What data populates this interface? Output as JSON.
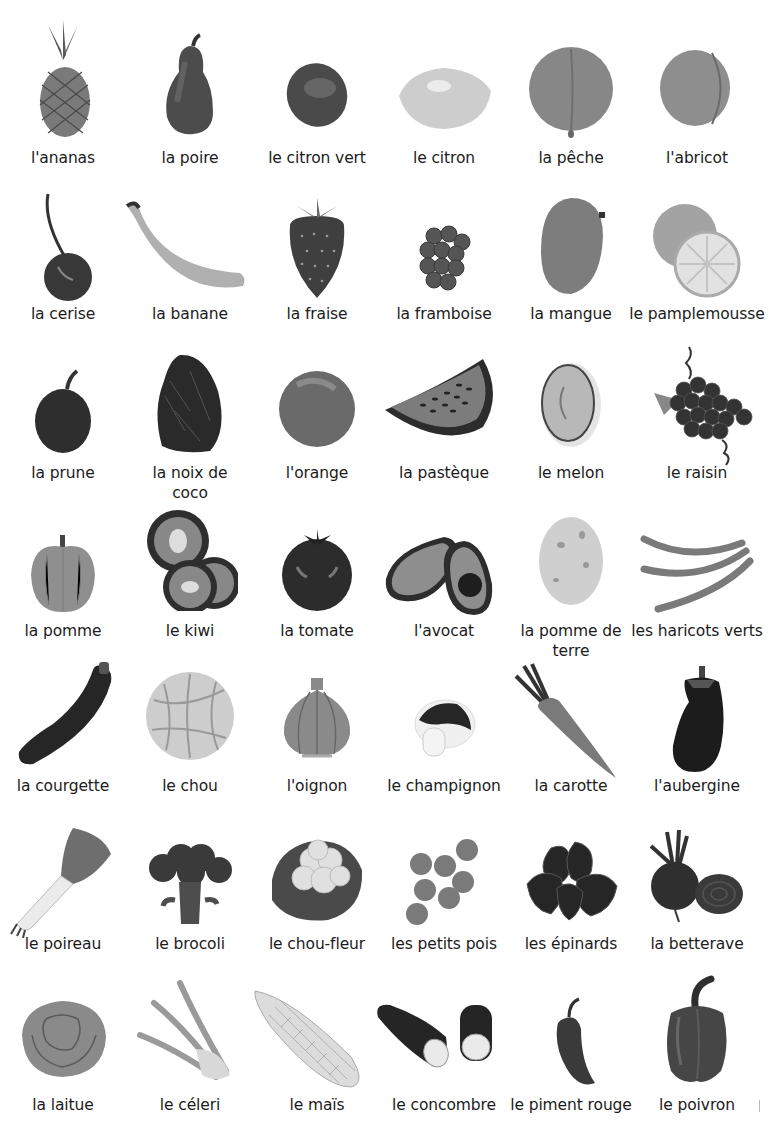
{
  "page": {
    "title": "",
    "columns": 6,
    "rows": [
      {
        "items": [
          {
            "label": "l'ananas",
            "icon": "pineapple-icon"
          },
          {
            "label": "la poire",
            "icon": "pear-icon"
          },
          {
            "label": "le citron vert",
            "icon": "lime-icon"
          },
          {
            "label": "le citron",
            "icon": "lemon-icon"
          },
          {
            "label": "la pêche",
            "icon": "peach-icon"
          },
          {
            "label": "l'abricot",
            "icon": "apricot-icon"
          }
        ]
      },
      {
        "items": [
          {
            "label": "la cerise",
            "icon": "cherry-icon"
          },
          {
            "label": "la banane",
            "icon": "banana-icon"
          },
          {
            "label": "la fraise",
            "icon": "strawberry-icon"
          },
          {
            "label": "la framboise",
            "icon": "raspberry-icon"
          },
          {
            "label": "la mangue",
            "icon": "mango-icon"
          },
          {
            "label": "le pamplemousse",
            "icon": "grapefruit-icon"
          }
        ]
      },
      {
        "items": [
          {
            "label": "la prune",
            "icon": "plum-icon"
          },
          {
            "label": "la noix de coco",
            "icon": "coconut-icon"
          },
          {
            "label": "l'orange",
            "icon": "orange-icon"
          },
          {
            "label": "la pastèque",
            "icon": "watermelon-icon"
          },
          {
            "label": "le melon",
            "icon": "melon-icon"
          },
          {
            "label": "le raisin",
            "icon": "grapes-icon"
          }
        ]
      },
      {
        "items": [
          {
            "label": "la pomme",
            "icon": "apple-icon"
          },
          {
            "label": "le kiwi",
            "icon": "kiwi-icon"
          },
          {
            "label": "la tomate",
            "icon": "tomato-icon"
          },
          {
            "label": "l'avocat",
            "icon": "avocado-icon"
          },
          {
            "label": "la pomme de terre",
            "icon": "potato-icon"
          },
          {
            "label": "les haricots verts",
            "icon": "green-beans-icon"
          }
        ]
      },
      {
        "items": [
          {
            "label": "la courgette",
            "icon": "zucchini-icon"
          },
          {
            "label": "le chou",
            "icon": "cabbage-icon"
          },
          {
            "label": "l'oignon",
            "icon": "onion-icon"
          },
          {
            "label": "le champignon",
            "icon": "mushroom-icon"
          },
          {
            "label": "la carotte",
            "icon": "carrot-icon"
          },
          {
            "label": "l'aubergine",
            "icon": "eggplant-icon"
          }
        ]
      },
      {
        "items": [
          {
            "label": "le poireau",
            "icon": "leek-icon"
          },
          {
            "label": "le brocoli",
            "icon": "broccoli-icon"
          },
          {
            "label": "le chou-fleur",
            "icon": "cauliflower-icon"
          },
          {
            "label": "les petits pois",
            "icon": "peas-icon"
          },
          {
            "label": "les épinards",
            "icon": "spinach-icon"
          },
          {
            "label": "la betterave",
            "icon": "beetroot-icon"
          }
        ]
      },
      {
        "items": [
          {
            "label": "la laitue",
            "icon": "lettuce-icon"
          },
          {
            "label": "le céleri",
            "icon": "celery-icon"
          },
          {
            "label": "le maïs",
            "icon": "corn-icon"
          },
          {
            "label": "le concombre",
            "icon": "cucumber-icon"
          },
          {
            "label": "le piment rouge",
            "icon": "chili-pepper-icon"
          },
          {
            "label": "le poivron",
            "icon": "bell-pepper-icon"
          }
        ]
      }
    ]
  },
  "labels_multiline": {
    "coconut": [
      "la noix de",
      "coco"
    ],
    "potato": [
      "la pomme de",
      "terre"
    ]
  },
  "colors": {
    "background": "#ffffff",
    "text": "#1b1b1b",
    "dark_tone": "#2b2b2b",
    "mid_tone": "#6f6f6f",
    "light_tone": "#c8c8c8"
  }
}
